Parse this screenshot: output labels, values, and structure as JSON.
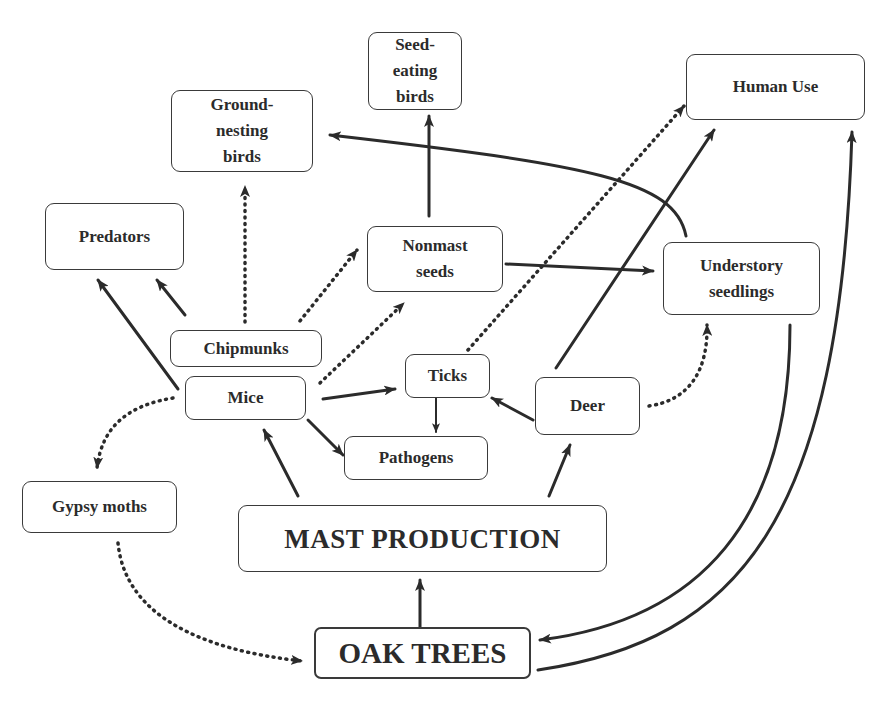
{
  "diagram": {
    "type": "ecological-interaction-web",
    "colors": {
      "stroke": "#2b2b2b",
      "background": "#ffffff"
    },
    "nodes": {
      "seed_eating_birds": {
        "label": "Seed-\neating\nbirds"
      },
      "ground_nesting_birds": {
        "label": "Ground-\nnesting\nbirds"
      },
      "human_use": {
        "label": "Human Use"
      },
      "predators": {
        "label": "Predators"
      },
      "nonmast_seeds": {
        "label": "Nonmast\nseeds"
      },
      "understory_seedlings": {
        "label": "Understory\nseedlings"
      },
      "chipmunks": {
        "label": "Chipmunks"
      },
      "mice": {
        "label": "Mice"
      },
      "ticks": {
        "label": "Ticks"
      },
      "deer": {
        "label": "Deer"
      },
      "pathogens": {
        "label": "Pathogens"
      },
      "gypsy_moths": {
        "label": "Gypsy moths"
      },
      "mast_production": {
        "label": "MAST PRODUCTION"
      },
      "oak_trees": {
        "label": "OAK TREES"
      }
    },
    "edges": [
      {
        "from": "oak_trees",
        "to": "mast_production",
        "style": "solid"
      },
      {
        "from": "mast_production",
        "to": "mice",
        "style": "solid"
      },
      {
        "from": "mast_production",
        "to": "deer",
        "style": "solid"
      },
      {
        "from": "mice",
        "to": "predators",
        "style": "solid"
      },
      {
        "from": "chipmunks",
        "to": "predators",
        "style": "solid"
      },
      {
        "from": "chipmunks",
        "to": "ground_nesting_birds",
        "style": "dotted"
      },
      {
        "from": "chipmunks",
        "to": "nonmast_seeds",
        "style": "dotted"
      },
      {
        "from": "mice",
        "to": "nonmast_seeds",
        "style": "dotted"
      },
      {
        "from": "mice",
        "to": "ticks",
        "style": "solid"
      },
      {
        "from": "mice",
        "to": "pathogens",
        "style": "solid"
      },
      {
        "from": "mice",
        "to": "gypsy_moths",
        "style": "dotted"
      },
      {
        "from": "ticks",
        "to": "pathogens",
        "style": "solid"
      },
      {
        "from": "ticks",
        "to": "human_use",
        "style": "dotted"
      },
      {
        "from": "deer",
        "to": "ticks",
        "style": "solid"
      },
      {
        "from": "deer",
        "to": "human_use",
        "style": "solid"
      },
      {
        "from": "deer",
        "to": "understory_seedlings",
        "style": "dotted"
      },
      {
        "from": "nonmast_seeds",
        "to": "seed_eating_birds",
        "style": "solid"
      },
      {
        "from": "nonmast_seeds",
        "to": "understory_seedlings",
        "style": "solid"
      },
      {
        "from": "understory_seedlings",
        "to": "ground_nesting_birds",
        "style": "solid"
      },
      {
        "from": "understory_seedlings",
        "to": "oak_trees",
        "style": "solid"
      },
      {
        "from": "oak_trees",
        "to": "human_use",
        "style": "solid"
      },
      {
        "from": "gypsy_moths",
        "to": "oak_trees",
        "style": "dotted"
      }
    ]
  }
}
